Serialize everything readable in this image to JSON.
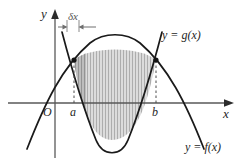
{
  "figure": {
    "background_color": "#ffffff",
    "width": 243,
    "height": 165
  },
  "axes": {
    "y_axis_label": "y",
    "x_axis_label": "x",
    "origin_label": "O",
    "axis_color": "#555555",
    "x_axis_y_px": 103,
    "y_axis_x_px": 55
  },
  "tick_labels": {
    "lower_limit": "a",
    "upper_limit": "b",
    "lower_limit_x_px": 74,
    "upper_limit_x_px": 156
  },
  "annotations": {
    "element_width": "δx",
    "element_width_name": "delta-x",
    "strip_left_x_px": 74,
    "strip_right_x_px": 86
  },
  "curves": [
    {
      "name": "upper-curve",
      "label": "y = f(x)",
      "function_name": "f",
      "shape": "downward-parabola",
      "color": "#1a1a1a",
      "vertex_px": [
        115,
        43
      ]
    },
    {
      "name": "lower-curve",
      "label": "y = g(x)",
      "function_name": "g",
      "shape": "upward-parabola",
      "color": "#1a1a1a",
      "vertex_px": [
        112,
        140
      ]
    }
  ],
  "region": {
    "name": "area-between-curves",
    "fill_color": "#d9d9d9",
    "hatch_color": "#a6a6a6",
    "strip_fill_color": "#b3b3b3",
    "from": "a",
    "to": "b"
  },
  "intersection_points": [
    {
      "name": "intersection-at-a",
      "x_px": 74,
      "y_px": 60
    },
    {
      "name": "intersection-at-b",
      "x_px": 156,
      "y_px": 60
    }
  ],
  "guide_lines": {
    "style": "dashed",
    "color": "#4d4d4d"
  }
}
